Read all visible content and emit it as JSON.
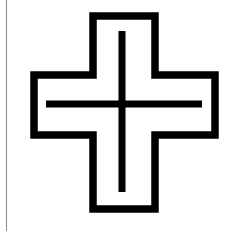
{
  "canvas": {
    "width": 231,
    "height": 234,
    "background_color": "#ffffff"
  },
  "figure": {
    "name": "outlined-cross-with-inner-plus",
    "stroke_color": "#000000",
    "fill_color": "#ffffff",
    "outline_stroke_width": 7.5,
    "inner_plus_stroke_width": 7,
    "outer_cross": {
      "bounds": {
        "left": 30,
        "top": 12,
        "right": 219,
        "bottom": 213
      },
      "arm_thickness": 59,
      "center_x": 122,
      "center_y": 104,
      "path": "M 93 16 L 155 16 L 155 75 L 215 75 L 215 135 L 155 135 L 155 209 L 93 209 L 93 135 L 34 135 L 34 75 L 93 75 Z"
    },
    "inner_plus": {
      "horizontal_bar": {
        "x1": 46,
        "y1": 104,
        "x2": 202,
        "y2": 104
      },
      "vertical_bar": {
        "x1": 122,
        "y1": 31,
        "x2": 122,
        "y2": 192
      }
    }
  },
  "margin_rule": {
    "name": "left-margin-rule",
    "description": "Thin vertical grey line near the left edge of the page",
    "color": "#8a8a8a",
    "x": 6,
    "y_start": 0,
    "y_end": 231,
    "width": 1
  }
}
